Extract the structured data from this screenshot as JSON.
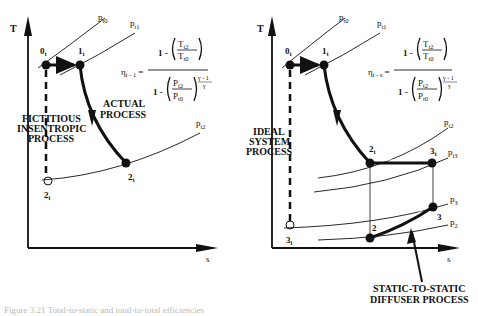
{
  "left_diagram": {
    "axis_y": "T",
    "axis_x": "s",
    "isobars": [
      "p_t0",
      "p_t1",
      "p_t2"
    ],
    "states": [
      "0_t",
      "1_t",
      "2_t",
      "2_i"
    ],
    "labels": {
      "actual": [
        "ACTUAL",
        "PROCESS"
      ],
      "fictitious": [
        "FICTITIOUS",
        "INSENTROPIC",
        "PROCESS"
      ]
    },
    "formula": {
      "lhs": "η",
      "lhs_sub": "t - 1",
      "num": "1 - (T_t2 / T_t0)",
      "den": "1 - (P_t2 / P_t0)^((γ-1)/γ)"
    }
  },
  "right_diagram": {
    "axis_y": "T",
    "axis_x": "s",
    "isobars": [
      "p_t0",
      "p_t1",
      "p_t2",
      "p_t3",
      "p_3",
      "p_2"
    ],
    "states": [
      "0_t",
      "1_t",
      "2_t",
      "3_t",
      "2",
      "3",
      "3_i"
    ],
    "labels": {
      "ideal": [
        "IDEAL",
        "SYSTEM",
        "PROCESS"
      ],
      "diffuser": [
        "STATIC-TO-STATIC",
        "DIFFUSER PROCESS"
      ]
    },
    "formula": {
      "lhs": "η",
      "lhs_sub": "t - s",
      "num": "1 - (T_t2 / T_t0)",
      "den": "1 - (P_t2 / P_t0)^((γ-1)/γ)"
    }
  },
  "text": {
    "T": "T",
    "s": "s",
    "p": "p",
    "P": "P",
    "one_minus": "1 -",
    "eq": "=",
    "eta": "η",
    "gamma_exp_num": "γ - 1",
    "gamma_exp_den": "γ",
    "sub_t0": "t0",
    "sub_t1": "t1",
    "sub_t2": "t2",
    "sub_t3": "t3",
    "sub_3": "3",
    "sub_2": "2",
    "s0": "0",
    "s1": "1",
    "s2": "2",
    "s3": "3",
    "sub_t": "t",
    "sub_i": "i",
    "lhs_left": "t - 1",
    "lhs_right": "t - s",
    "actual_1": "ACTUAL",
    "actual_2": "PROCESS",
    "fict_1": "FICTITIOUS",
    "fict_2": "INSENTROPIC",
    "fict_3": "PROCESS",
    "ideal_1": "IDEAL",
    "ideal_2": "SYSTEM",
    "ideal_3": "PROCESS",
    "diff_1": "STATIC-TO-STATIC",
    "diff_2": "DIFFUSER PROCESS",
    "T_letter": "T"
  },
  "caption": "Figure 3.21  Total-to-static and total-to-total efficiencies"
}
